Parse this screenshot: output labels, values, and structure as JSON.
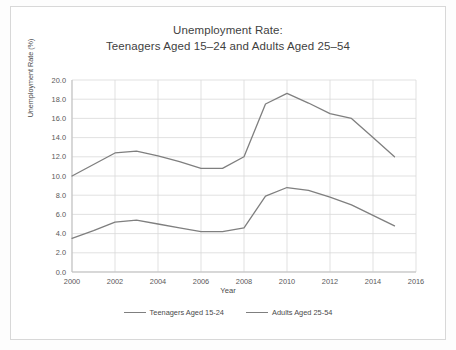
{
  "chart_data": {
    "type": "line",
    "title": "Unemployment Rate:",
    "subtitle": "Teenagers Aged 15–24 and Adults Aged 25–54",
    "xlabel": "Year",
    "ylabel": "Unemployment Rate (%)",
    "xlim": [
      2000,
      2016
    ],
    "ylim": [
      0.0,
      20.0
    ],
    "grid": true,
    "legend_position": "bottom",
    "xticks": [
      "2000",
      "2002",
      "2004",
      "2006",
      "2008",
      "2010",
      "2012",
      "2014",
      "2016"
    ],
    "yticks": [
      "0.0",
      "2.0",
      "4.0",
      "6.0",
      "8.0",
      "10.0",
      "12.0",
      "14.0",
      "16.0",
      "18.0",
      "20.0"
    ],
    "x": [
      2000,
      2001,
      2002,
      2003,
      2004,
      2005,
      2006,
      2007,
      2008,
      2009,
      2010,
      2011,
      2012,
      2013,
      2014,
      2015
    ],
    "series": [
      {
        "name": "Teenagers Aged 15-24",
        "color": "#7f7f7f",
        "values": [
          10.0,
          11.2,
          12.4,
          12.6,
          12.1,
          11.5,
          10.8,
          10.8,
          12.0,
          17.5,
          18.6,
          17.6,
          16.5,
          16.0,
          14.0,
          12.0
        ]
      },
      {
        "name": "Adults Aged 25-54",
        "color": "#7f7f7f",
        "values": [
          3.5,
          4.3,
          5.2,
          5.4,
          5.0,
          4.6,
          4.2,
          4.2,
          4.6,
          7.9,
          8.8,
          8.5,
          7.8,
          7.0,
          5.9,
          4.8
        ]
      }
    ]
  },
  "legend": {
    "items": [
      {
        "label": "Teenagers Aged 15-24"
      },
      {
        "label": "Adults Aged 25-54"
      }
    ]
  }
}
